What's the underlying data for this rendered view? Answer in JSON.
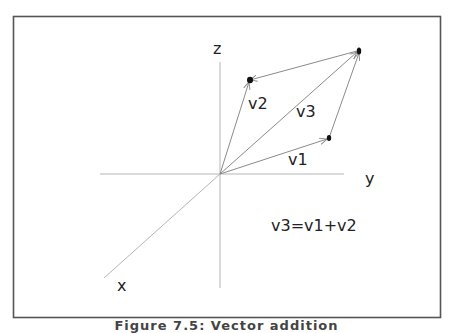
{
  "figure": {
    "caption": "Figure 7.5: Vector addition",
    "frame_color": "#555555",
    "axis_color": "#b5b5b5",
    "vector_color": "#8a8a8a",
    "dot_color": "#111111"
  },
  "axes": {
    "x_label": "x",
    "y_label": "y",
    "z_label": "z"
  },
  "vectors": [
    {
      "name": "v1",
      "label": "v1"
    },
    {
      "name": "v2",
      "label": "v2"
    },
    {
      "name": "v3",
      "label": "v3"
    }
  ],
  "equation": "v3=v1+v2"
}
